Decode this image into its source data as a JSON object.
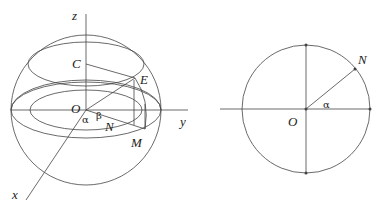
{
  "figure_left": {
    "title": "3D sphere with coordinate axes",
    "axes": {
      "z": "z",
      "y": "y",
      "x": "x"
    },
    "points": {
      "origin": "O",
      "C": "C",
      "E": "E",
      "N": "N",
      "M": "M"
    },
    "angles": {
      "alpha": "α",
      "beta": "β"
    }
  },
  "figure_right": {
    "title": "Circle cross-section",
    "points": {
      "origin": "O",
      "N": "N"
    },
    "angles": {
      "alpha": "α"
    }
  },
  "colors": {
    "stroke": "#444444",
    "text": "#222222",
    "background": "#ffffff"
  }
}
